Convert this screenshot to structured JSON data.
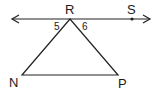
{
  "diagram": {
    "type": "geometry",
    "points": {
      "R": {
        "label": "R",
        "x": 70,
        "y": 19
      },
      "S": {
        "label": "S",
        "x": 132,
        "y": 19
      },
      "N": {
        "label": "N",
        "x": 22,
        "y": 75
      },
      "P": {
        "label": "P",
        "x": 118,
        "y": 75
      }
    },
    "angles": [
      {
        "label": "5",
        "at": "R",
        "between": [
          "line-left",
          "RN"
        ]
      },
      {
        "label": "6",
        "at": "R",
        "between": [
          "RP",
          "line-right"
        ]
      }
    ],
    "line": {
      "through": [
        "R",
        "S"
      ],
      "arrows": "both"
    },
    "colors": {
      "stroke": "#222222",
      "text": "#1a1a1a",
      "background": "#ffffff"
    }
  }
}
